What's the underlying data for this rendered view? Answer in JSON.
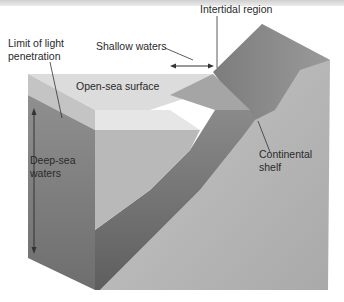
{
  "figure": {
    "labels": {
      "intertidal": "Intertidal region",
      "limit_line1": "Limit of light",
      "limit_line2": "penetration",
      "shallow": "Shallow waters",
      "open_sea": "Open-sea surface",
      "deep_line1": "Deep-sea",
      "deep_line2": "waters",
      "shelf_line1": "Continental",
      "shelf_line2": "shelf"
    },
    "colors": {
      "land_top": "#8a8a8a",
      "land_face": "#b8b8b8",
      "water_light": "#d9d9d9",
      "water_dark": "#7a7a7a",
      "line": "#333333"
    }
  }
}
